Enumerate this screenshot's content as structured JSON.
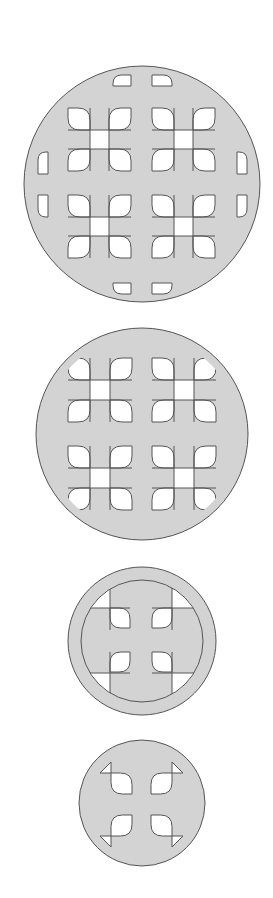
{
  "canvas": {
    "width": 273,
    "height": 898,
    "background": "#ffffff"
  },
  "colors": {
    "fill": "#d3d3d3",
    "hole": "#ffffff",
    "stroke": "#555555"
  },
  "figures": [
    {
      "name": "disc-1",
      "cx": 142,
      "cy": 184,
      "r": 118,
      "clip_r": 112,
      "clusters": [
        {
          "x": 68,
          "y": 108,
          "size": 63
        },
        {
          "x": 152,
          "y": 108,
          "size": 63
        },
        {
          "x": 68,
          "y": 195,
          "size": 63
        },
        {
          "x": 152,
          "y": 195,
          "size": 63
        }
      ],
      "edge_petals": [
        {
          "x": 113,
          "y": 75,
          "w": 18,
          "h": 11,
          "round": "tl"
        },
        {
          "x": 152,
          "y": 75,
          "w": 20,
          "h": 11,
          "round": "tr"
        },
        {
          "x": 113,
          "y": 283,
          "w": 18,
          "h": 11,
          "round": "bl"
        },
        {
          "x": 152,
          "y": 283,
          "w": 20,
          "h": 11,
          "round": "br"
        },
        {
          "x": 38,
          "y": 152,
          "w": 10,
          "h": 22,
          "round": "tl"
        },
        {
          "x": 38,
          "y": 195,
          "w": 10,
          "h": 22,
          "round": "bl"
        },
        {
          "x": 237,
          "y": 152,
          "w": 10,
          "h": 22,
          "round": "tr"
        },
        {
          "x": 237,
          "y": 195,
          "w": 10,
          "h": 22,
          "round": "br"
        }
      ]
    },
    {
      "name": "disc-2",
      "cx": 142,
      "cy": 434,
      "r": 106,
      "clip_r": 98,
      "clusters": [
        {
          "x": 68,
          "y": 358,
          "size": 64
        },
        {
          "x": 152,
          "y": 358,
          "size": 64
        },
        {
          "x": 68,
          "y": 446,
          "size": 64
        },
        {
          "x": 152,
          "y": 446,
          "size": 64
        }
      ],
      "edge_petals": []
    },
    {
      "name": "disc-3",
      "cx": 142,
      "cy": 641,
      "r": 74,
      "clip_r": 61,
      "cross": {
        "x1": 110,
        "x2": 130,
        "x3": 152,
        "x4": 172,
        "y1": 608,
        "y2": 630,
        "y3": 652,
        "y4": 673
      },
      "clusters": [],
      "edge_petals": []
    },
    {
      "name": "disc-4",
      "cx": 142,
      "cy": 803,
      "r": 63,
      "clip_r": 50,
      "petals": [
        {
          "x": 111,
          "y": 773,
          "w": 21,
          "h": 21,
          "corner": "tl"
        },
        {
          "x": 151,
          "y": 773,
          "w": 21,
          "h": 21,
          "corner": "tr"
        },
        {
          "x": 111,
          "y": 815,
          "w": 21,
          "h": 21,
          "corner": "bl"
        },
        {
          "x": 151,
          "y": 815,
          "w": 21,
          "h": 21,
          "corner": "br"
        }
      ],
      "clusters": [],
      "edge_petals": []
    }
  ]
}
